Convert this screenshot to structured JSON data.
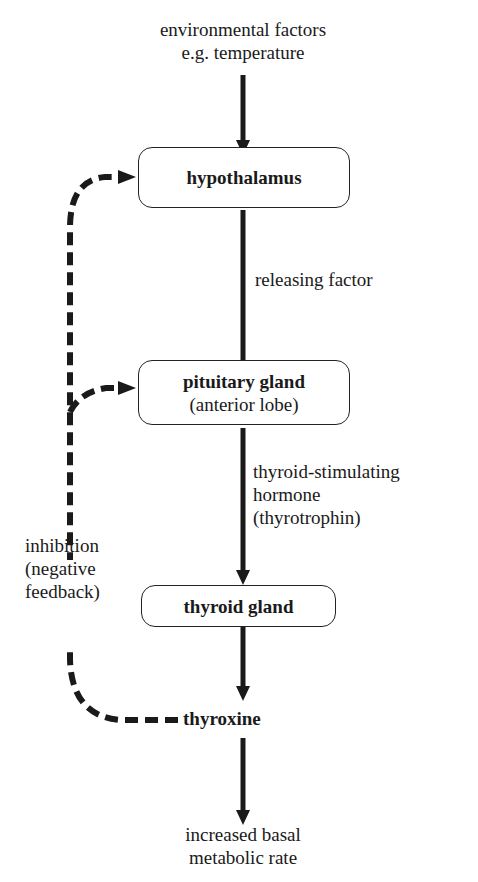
{
  "diagram": {
    "type": "flowchart",
    "input": {
      "line1": "environmental factors",
      "line2": "e.g. temperature"
    },
    "nodes": {
      "hypothalamus": {
        "label": "hypothalamus"
      },
      "pituitary": {
        "label": "pituitary gland",
        "sublabel": "(anterior lobe)"
      },
      "thyroid": {
        "label": "thyroid gland"
      },
      "thyroxine": {
        "label": "thyroxine"
      }
    },
    "edges": {
      "releasing_factor": {
        "label": "releasing factor"
      },
      "tsh": {
        "line1": "thyroid-stimulating",
        "line2": "hormone",
        "line3": "(thyrotrophin)"
      }
    },
    "feedback": {
      "line1": "inhibition",
      "line2": "(negative",
      "line3": "feedback)"
    },
    "output": {
      "line1": "increased basal",
      "line2": "metabolic rate"
    },
    "colors": {
      "ink": "#1a1a1a",
      "background": "#ffffff"
    }
  }
}
